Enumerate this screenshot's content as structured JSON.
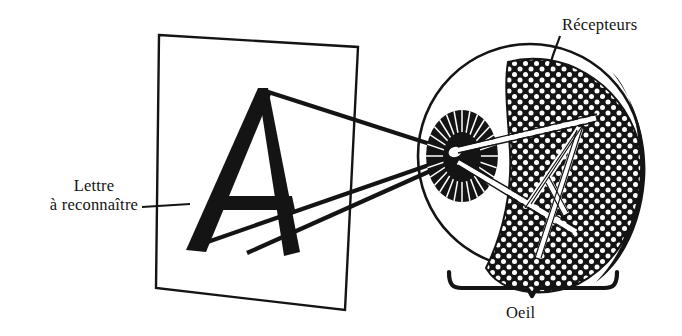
{
  "figure": {
    "background_color": "#ffffff",
    "ink_color": "#141414"
  },
  "labels": {
    "letter_to_recognize": {
      "line1": "Lettre",
      "line2": "à reconnaître"
    },
    "receptors": "Récepteurs",
    "eye": "Oeil"
  },
  "stimulus": {
    "letter": "A",
    "surface": "sheet-of-paper"
  },
  "eye_parts": {
    "lens": "lens-with-radial-striations",
    "pupil": "pupil-aperture",
    "retina": "retina-with-receptor-dots",
    "projected_image": "inverted-letter-A"
  },
  "rays": {
    "count": 3,
    "description": "light-rays-converging-on-pupil"
  }
}
